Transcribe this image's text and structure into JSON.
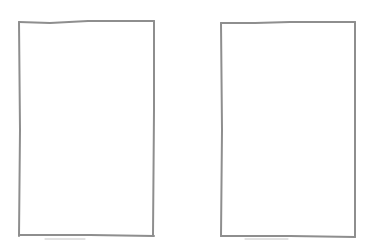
{
  "canvas": {
    "width": 373,
    "height": 252,
    "background": "#ffffff"
  },
  "stroke_color": "#8e8e8e",
  "panels": [
    {
      "name": "left-frame",
      "x1": 19,
      "y1": 21,
      "x2": 154,
      "y2": 236
    },
    {
      "name": "right-frame",
      "x1": 221,
      "y1": 22,
      "x2": 355,
      "y2": 237
    }
  ]
}
